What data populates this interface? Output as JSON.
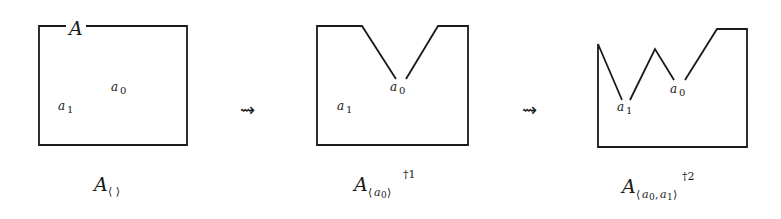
{
  "diagram": {
    "arrows": [
      {
        "symbol": "⇝"
      },
      {
        "symbol": "⇝"
      }
    ],
    "panels": [
      {
        "set_label": "A",
        "points": {
          "a0": "a",
          "a0_sub": "0",
          "a1": "a",
          "a1_sub": "1"
        },
        "caption": {
          "main": "A",
          "subscript": "⟨ ⟩",
          "superscript": ""
        }
      },
      {
        "points": {
          "a0": "a",
          "a0_sub": "0",
          "a1": "a",
          "a1_sub": "1"
        },
        "caption": {
          "main": "A",
          "subscript_open": "⟨",
          "subscript_var": "a",
          "subscript_idx": "0",
          "subscript_close": "⟩",
          "superscript": "†1"
        }
      },
      {
        "points": {
          "a0": "a",
          "a0_sub": "0",
          "a1": "a",
          "a1_sub": "1"
        },
        "caption": {
          "main": "A",
          "subscript_open": "⟨",
          "subscript_var0": "a",
          "subscript_idx0": "0",
          "subscript_sep": ",",
          "subscript_var1": "a",
          "subscript_idx1": "1",
          "subscript_close": "⟩",
          "superscript": "†2"
        }
      }
    ]
  }
}
